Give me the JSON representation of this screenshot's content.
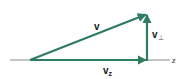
{
  "diagram": {
    "title": "",
    "colors": {
      "vector": "#2e7d5e",
      "axis": "#8a8a8a",
      "text": "#222222"
    },
    "axis": {
      "label": "z",
      "x1": 10,
      "x2": 170,
      "y": 60
    },
    "origin": {
      "x": 30,
      "y": 60
    },
    "vectors": [
      {
        "id": "v",
        "label": "v",
        "from": [
          30,
          60
        ],
        "to": [
          147,
          14
        ]
      },
      {
        "id": "vz",
        "label": "v",
        "subscript": "z",
        "from": [
          30,
          60
        ],
        "to": [
          147,
          60
        ]
      },
      {
        "id": "vperp",
        "label": "v",
        "subscript": "⊥",
        "from": [
          147,
          60
        ],
        "to": [
          147,
          14
        ]
      }
    ],
    "labels": {
      "v": "v",
      "vz_main": "v",
      "vz_sub": "z",
      "vperp_main": "v",
      "vperp_sub": "⊥",
      "axis": "z"
    }
  }
}
